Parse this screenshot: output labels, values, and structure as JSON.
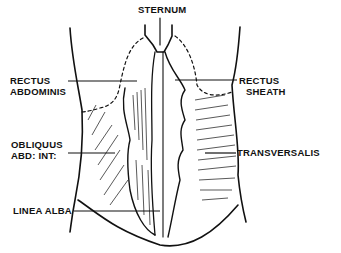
{
  "diagram": {
    "type": "anatomical-illustration",
    "labels": {
      "sternum": "STERNUM",
      "rectus_abdominis_1": "RECTUS",
      "rectus_abdominis_2": "ABDOMINIS",
      "rectus_sheath_1": "RECTUS",
      "rectus_sheath_2": "SHEATH",
      "obliquus_1": "OBLIQUUS",
      "obliquus_2": "ABD: INT:",
      "transversalis": "TRANSVERSALIS",
      "linea_alba": "LINEA ALBA"
    },
    "colors": {
      "ink": "#111111",
      "background": "#ffffff"
    }
  }
}
